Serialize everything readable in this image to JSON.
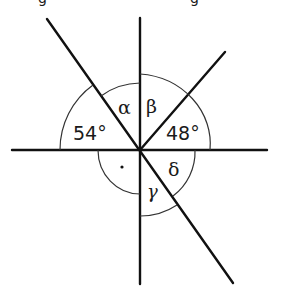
{
  "diagram": {
    "type": "intersecting lines angle diagram",
    "labels": {
      "left_upper_angle": "54°",
      "alpha": "α",
      "beta": "β",
      "right_upper_angle": "48°",
      "right_angle_mark": "·",
      "gamma": "γ",
      "delta": "δ"
    },
    "top_cutoff_text": {
      "left": "g",
      "right": "g"
    }
  }
}
